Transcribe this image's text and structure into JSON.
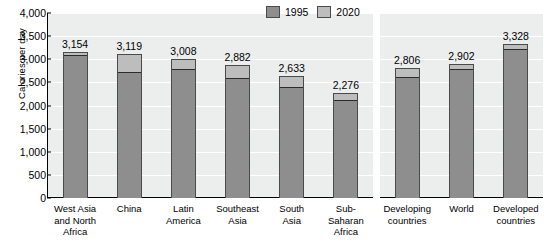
{
  "chart_data": {
    "type": "bar",
    "title": "",
    "subtitle": "",
    "xlabel": "",
    "ylabel": "Calories per day",
    "ylim": [
      0,
      4000
    ],
    "ytick_step": 500,
    "yticks": [
      "4,000",
      "3,500",
      "3,000",
      "2,500",
      "2,000",
      "1,500",
      "1,000",
      "500",
      "0"
    ],
    "ytick_values": [
      4000,
      3500,
      3000,
      2500,
      2000,
      1500,
      1000,
      500,
      0
    ],
    "grid": "horizontal",
    "legend_position": "top-center",
    "stacked_overlay": true,
    "legend": [
      "1995",
      "2020"
    ],
    "categories": [
      "West Asia\nand North\nAfrica",
      "China",
      "Latin\nAmerica",
      "Southeast\nAsia",
      "South\nAsia",
      "Sub-\nSaharan\nAfrica",
      "Developing\ncountries",
      "World",
      "Developed\ncountries"
    ],
    "panels": [
      {
        "name": "regions",
        "category_indices": [
          0,
          1,
          2,
          3,
          4,
          5
        ]
      },
      {
        "name": "aggregates",
        "category_indices": [
          6,
          7,
          8
        ]
      }
    ],
    "series": [
      {
        "name": "1995",
        "values": [
          3100,
          2730,
          2780,
          2590,
          2390,
          2120,
          2610,
          2790,
          3230
        ],
        "color": "#8e8e8e"
      },
      {
        "name": "2020",
        "values": [
          3154,
          3119,
          3008,
          2882,
          2633,
          2276,
          2806,
          2902,
          3328
        ],
        "color": "#bdbdbd"
      }
    ],
    "value_labels": [
      "3,154",
      "3,119",
      "3,008",
      "2,882",
      "2,633",
      "2,276",
      "2,806",
      "2,902",
      "3,328"
    ]
  },
  "colors": {
    "plot_background": "#eceded",
    "gridline": "#ffffff",
    "axis": "#000000",
    "bar_1995": "#8e8e8e",
    "bar_2020": "#bdbdbd",
    "bar_outline": "#4a4a4a",
    "page_background": "#ffffff"
  }
}
